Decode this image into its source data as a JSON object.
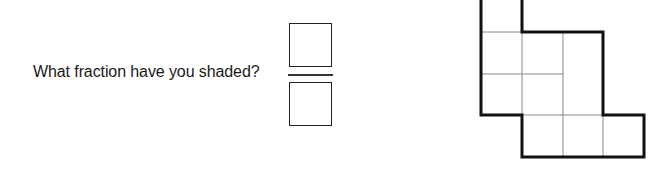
{
  "question": {
    "text": "What fraction have you shaded?"
  },
  "answer": {
    "numerator": "",
    "denominator": ""
  },
  "grid": {
    "cell_size": 40.75,
    "origin_x": 481,
    "row_y": [
      -9,
      32,
      74,
      115,
      157
    ],
    "col_x": [
      481,
      522,
      563,
      603,
      644
    ],
    "cells": [
      {
        "row": 0,
        "col": 0
      },
      {
        "row": 1,
        "col": 0
      },
      {
        "row": 1,
        "col": 1
      },
      {
        "row": 1,
        "col": 2
      },
      {
        "row": 2,
        "col": 0
      },
      {
        "row": 2,
        "col": 1
      },
      {
        "row": 2,
        "col": 2
      },
      {
        "row": 3,
        "col": 1
      },
      {
        "row": 3,
        "col": 2
      },
      {
        "row": 3,
        "col": 3
      }
    ],
    "shaded_count": 0,
    "total_cells": 10
  },
  "colors": {
    "outline": "#111111",
    "inner_line": "#8a8a8a",
    "text": "#1a1a1a"
  }
}
